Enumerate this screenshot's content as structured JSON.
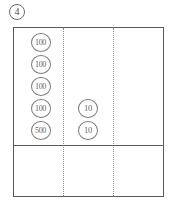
{
  "problem": {
    "number": "4"
  },
  "colors": {
    "border": "#5a5a5a",
    "divider_dotted": "#8a8a8a",
    "coin_outline": "#7a7a7a",
    "text": "#5f5f5f",
    "background": "#ffffff"
  },
  "grid": {
    "columns": 3,
    "rows": 2,
    "column_divider_style": "dotted",
    "row_divider_style": "solid",
    "cells": [
      {
        "row": 0,
        "column": 0,
        "coins": [
          "100",
          "100",
          "100",
          "100",
          "500"
        ]
      },
      {
        "row": 0,
        "column": 1,
        "coins": [
          "10",
          "10"
        ]
      },
      {
        "row": 0,
        "column": 2,
        "coins": []
      },
      {
        "row": 1,
        "column": 0,
        "coins": []
      },
      {
        "row": 1,
        "column": 1,
        "coins": []
      },
      {
        "row": 1,
        "column": 2,
        "coins": []
      }
    ]
  },
  "coins": {
    "hundreds_column": [
      {
        "label": "100"
      },
      {
        "label": "100"
      },
      {
        "label": "100"
      },
      {
        "label": "100"
      },
      {
        "label": "500"
      }
    ],
    "tens_column": [
      {
        "label": "10"
      },
      {
        "label": "10"
      }
    ]
  }
}
